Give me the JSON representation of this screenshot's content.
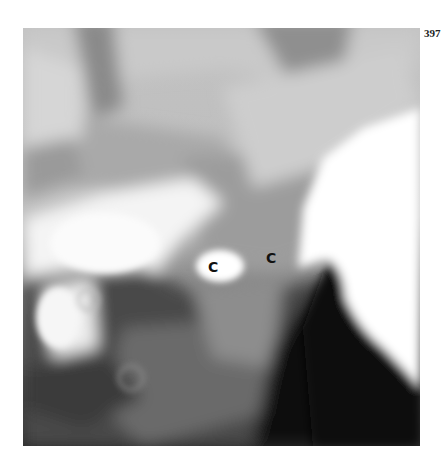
{
  "page": {
    "page_number": "397"
  },
  "figure": {
    "type": "radiograph",
    "labels": [
      {
        "text": "C",
        "x": 208,
        "y": 260
      },
      {
        "text": "C",
        "x": 266,
        "y": 251
      }
    ]
  }
}
